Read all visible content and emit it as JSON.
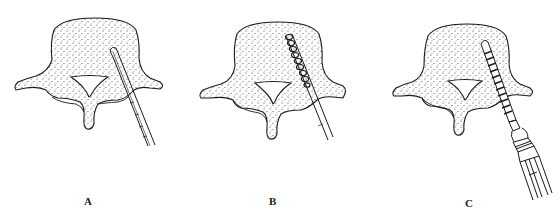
{
  "figure": {
    "colors": {
      "line": "#1a1a1a",
      "background": "#ffffff",
      "stipple": "#333333"
    },
    "panels": [
      {
        "id": "A",
        "label": "A",
        "step": "Probe/awl inserted through pedicle into vertebral body"
      },
      {
        "id": "B",
        "label": "B",
        "step": "Threaded tap advanced along the pedicle tract"
      },
      {
        "id": "C",
        "label": "C",
        "step": "Pedicle screw driven in with screwdriver"
      }
    ]
  }
}
